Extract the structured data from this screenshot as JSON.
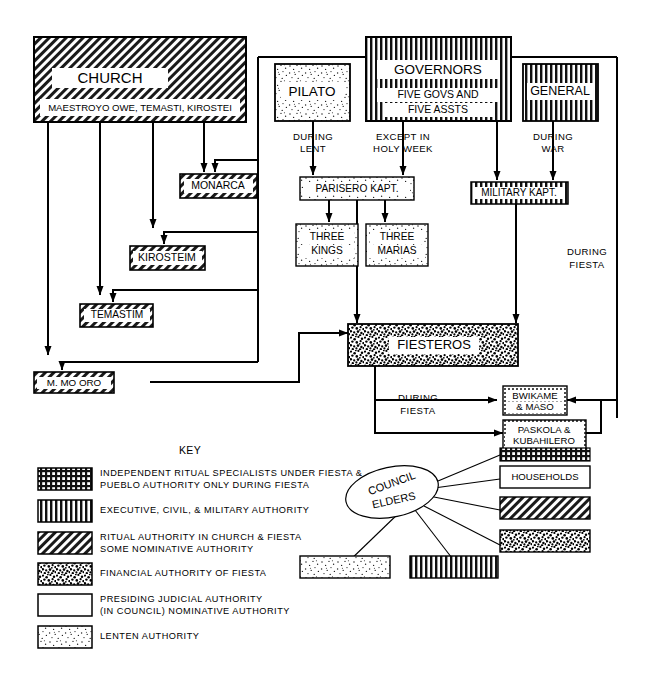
{
  "diagram": {
    "title_key": "KEY",
    "nodes": {
      "church": {
        "label": "CHURCH",
        "sub": "MAESTROYO OWE, TEMASTI, KIROSTEI",
        "pattern": "diagonal"
      },
      "pilato": {
        "label": "PILATO",
        "pattern": "lenten-stipple"
      },
      "governors": {
        "label": "GOVERNORS",
        "sub1": "FIVE GOVS AND",
        "sub2": "FIVE ASSTS",
        "pattern": "vertical"
      },
      "general": {
        "label": "GENERAL",
        "pattern": "vertical"
      },
      "monarca": {
        "label": "MONARCA",
        "pattern": "diagonal"
      },
      "kirosteim": {
        "label": "KIROSTEIM",
        "pattern": "diagonal"
      },
      "temastim": {
        "label": "TEMASTIM",
        "pattern": "diagonal"
      },
      "mmooro": {
        "label": "M. MO ORO",
        "pattern": "diagonal"
      },
      "parisero": {
        "label": "PARISERO KAPT.",
        "pattern": "lenten-stipple"
      },
      "three_kings": {
        "label1": "THREE",
        "label2": "KINGS",
        "pattern": "lenten-stipple"
      },
      "three_marias": {
        "label1": "THREE",
        "label2": "MARIAS",
        "pattern": "lenten-stipple"
      },
      "military": {
        "label": "MILITARY KAPT.",
        "pattern": "vertical"
      },
      "fiesteros": {
        "label": "FIESTEROS",
        "pattern": "dense-stipple"
      },
      "bwikame": {
        "label1": "BWIKAME",
        "label2": "& MASO",
        "pattern": "crosshatch"
      },
      "paskola": {
        "label1": "PASKOLA &",
        "label2": "KUBAHILERO",
        "pattern": "crosshatch"
      },
      "households": {
        "label": "HOUSEHOLDS",
        "pattern": "blank"
      },
      "council": {
        "label1": "COUNCIL",
        "label2": "ELDERS"
      }
    },
    "edge_labels": {
      "during_lent": [
        "DURING",
        "LENT"
      ],
      "except_holy_week": [
        "EXCEPT IN",
        "HOLY WEEK"
      ],
      "during_war": [
        "DURING",
        "WAR"
      ],
      "during_fiesta_right": [
        "DURING",
        "FIESTA"
      ],
      "during_fiesta_center": [
        "DURING",
        "FIESTA"
      ]
    },
    "key": {
      "heading": "KEY",
      "entries": [
        {
          "pattern": "crosshatch",
          "lines": [
            "INDEPENDENT RITUAL SPECIALISTS UNDER FIESTA &",
            "PUEBLO AUTHORITY ONLY DURING FIESTA"
          ]
        },
        {
          "pattern": "vertical",
          "lines": [
            "EXECUTIVE, CIVIL, & MILITARY AUTHORITY"
          ]
        },
        {
          "pattern": "diagonal",
          "lines": [
            "RITUAL AUTHORITY IN CHURCH & FIESTA",
            "SOME NOMINATIVE AUTHORITY"
          ]
        },
        {
          "pattern": "dense-stipple",
          "lines": [
            "FINANCIAL AUTHORITY OF FIESTA"
          ]
        },
        {
          "pattern": "blank",
          "lines": [
            "PRESIDING JUDICIAL AUTHORITY",
            "(IN COUNCIL) NOMINATIVE AUTHORITY"
          ]
        },
        {
          "pattern": "lenten-stipple",
          "lines": [
            "LENTEN AUTHORITY"
          ]
        }
      ]
    },
    "council_boxes": [
      {
        "pattern": "crosshatch"
      },
      {
        "pattern": "blank",
        "label": "HOUSEHOLDS"
      },
      {
        "pattern": "diagonal"
      },
      {
        "pattern": "dense-stipple"
      },
      {
        "pattern": "lenten-stipple"
      },
      {
        "pattern": "vertical"
      }
    ],
    "colors": {
      "ink": "#000000",
      "paper": "#ffffff"
    }
  }
}
